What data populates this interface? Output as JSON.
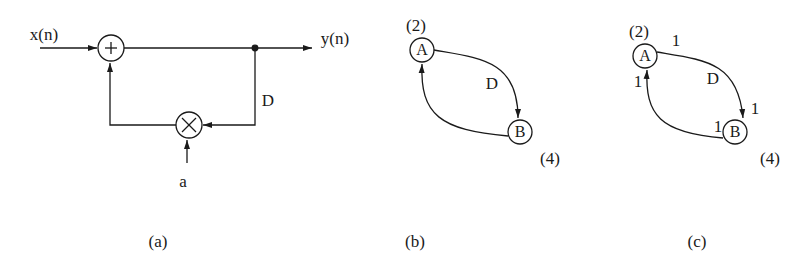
{
  "figure": {
    "panel_a": {
      "input_label": "x(n)",
      "output_label": "y(n)",
      "adder_symbol": "+",
      "multiplier_symbol": "×",
      "delay_label": "D",
      "coefficient_label": "a",
      "caption": "(a)"
    },
    "panel_b": {
      "node_a": "A",
      "node_b": "B",
      "node_a_time": "(2)",
      "node_b_time": "(4)",
      "edge_ab_delay": "D",
      "caption": "(b)"
    },
    "panel_c": {
      "node_a": "A",
      "node_b": "B",
      "node_a_time": "(2)",
      "node_b_time": "(4)",
      "edge_ab_delay": "D",
      "edge_ab_out_weight": "1",
      "edge_ab_in_weight": "1",
      "edge_ba_out_weight": "1",
      "edge_ba_in_weight": "1",
      "caption": "(c)"
    },
    "colors": {
      "ink": "#1a1a1a",
      "background": "#ffffff"
    }
  }
}
